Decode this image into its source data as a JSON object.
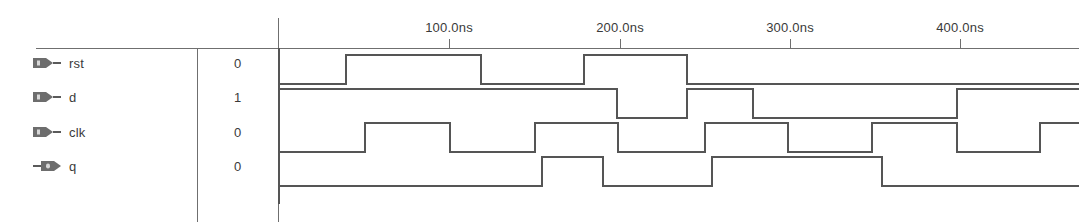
{
  "viewer": {
    "title": "waveform-viewer",
    "line_color": "#6f6f6f",
    "wave_color": "#555555",
    "text_color": "#3a3a3a",
    "background": "#ffffff"
  },
  "timeline": {
    "unit": "ns",
    "origin_x": 279,
    "pixels_per_100ns": 170,
    "ticks": [
      {
        "label": "100.0ns",
        "time_ns": 100,
        "x": 449
      },
      {
        "label": "200.0ns",
        "time_ns": 200,
        "x": 620
      },
      {
        "label": "300.0ns",
        "time_ns": 300,
        "x": 790
      },
      {
        "label": "400.0ns",
        "time_ns": 400,
        "x": 960
      }
    ]
  },
  "signals": [
    {
      "name": "rst",
      "value": "0",
      "direction": "input",
      "icon": "input-port-icon",
      "row_top": 0,
      "high_y": 55,
      "low_y": 84,
      "initial_level": 0,
      "transitions": [
        {
          "x": 346,
          "time_ns": 39,
          "to": 1
        },
        {
          "x": 481,
          "time_ns": 119,
          "to": 0
        },
        {
          "x": 584,
          "time_ns": 179,
          "to": 1
        },
        {
          "x": 687,
          "time_ns": 240,
          "to": 0
        }
      ]
    },
    {
      "name": "d",
      "value": "1",
      "direction": "input",
      "icon": "input-port-icon",
      "row_top": 34,
      "high_y": 89,
      "low_y": 118,
      "initial_level": 1,
      "transitions": [
        {
          "x": 617,
          "time_ns": 199,
          "to": 0
        },
        {
          "x": 687,
          "time_ns": 240,
          "to": 1
        },
        {
          "x": 753,
          "time_ns": 279,
          "to": 0
        },
        {
          "x": 957,
          "time_ns": 399,
          "to": 1
        }
      ]
    },
    {
      "name": "clk",
      "value": "0",
      "direction": "input",
      "icon": "input-port-icon",
      "row_top": 69,
      "high_y": 123,
      "low_y": 152,
      "initial_level": 0,
      "transitions": [
        {
          "x": 365,
          "time_ns": 50,
          "to": 1
        },
        {
          "x": 450,
          "time_ns": 100,
          "to": 0
        },
        {
          "x": 535,
          "time_ns": 150,
          "to": 1
        },
        {
          "x": 618,
          "time_ns": 200,
          "to": 0
        },
        {
          "x": 705,
          "time_ns": 250,
          "to": 1
        },
        {
          "x": 788,
          "time_ns": 300,
          "to": 0
        },
        {
          "x": 872,
          "time_ns": 350,
          "to": 1
        },
        {
          "x": 957,
          "time_ns": 400,
          "to": 0
        },
        {
          "x": 1040,
          "time_ns": 450,
          "to": 1
        }
      ]
    },
    {
      "name": "q",
      "value": "0",
      "direction": "output",
      "icon": "output-port-icon",
      "row_top": 103,
      "high_y": 157,
      "low_y": 186,
      "initial_level": 0,
      "transitions": [
        {
          "x": 542,
          "time_ns": 155,
          "to": 1
        },
        {
          "x": 603,
          "time_ns": 190,
          "to": 0
        },
        {
          "x": 712,
          "time_ns": 255,
          "to": 1
        },
        {
          "x": 882,
          "time_ns": 355,
          "to": 0
        }
      ]
    }
  ],
  "rules": {
    "header_line": {
      "x": 36,
      "y": 48,
      "width": 1043
    },
    "divider_names_values": {
      "x": 197,
      "y": 48,
      "height": 174
    },
    "divider_values_waves": {
      "x": 278,
      "y": 18,
      "height": 204
    },
    "wave_left_edge": {
      "x": 279,
      "y": 48,
      "height": 156
    }
  }
}
